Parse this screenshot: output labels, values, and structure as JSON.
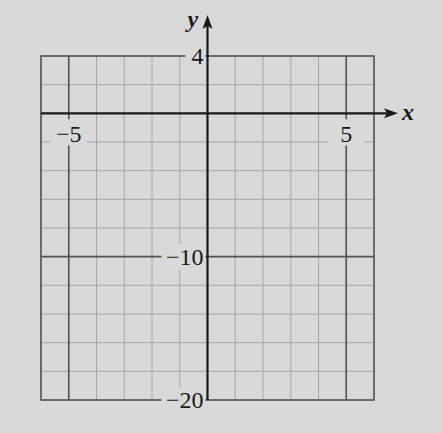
{
  "chart_data": {
    "type": "line",
    "title": "",
    "xlabel": "x",
    "ylabel": "y",
    "xlim": [
      -6,
      6
    ],
    "ylim": [
      -20,
      4
    ],
    "grid": true,
    "x_grid_step": 1,
    "y_grid_step": 2,
    "major_x_lines": [
      -5,
      5
    ],
    "major_y_lines": [
      -10
    ],
    "x_tick_labels": [
      {
        "value": -5,
        "text": "−5"
      },
      {
        "value": 5,
        "text": "5"
      }
    ],
    "y_tick_labels": [
      {
        "value": 4,
        "text": "4"
      },
      {
        "value": -10,
        "text": "−10"
      },
      {
        "value": -20,
        "text": "−20"
      }
    ],
    "series": [],
    "legend": null
  },
  "colors": {
    "background": "#d9d9d9",
    "grid": "#a6a6a6",
    "major": "#555555",
    "axis": "#1a1a1a"
  }
}
